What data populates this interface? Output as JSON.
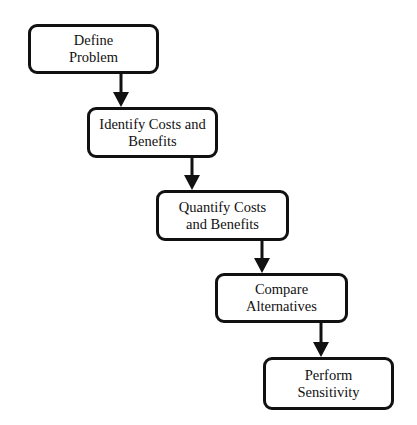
{
  "diagram": {
    "type": "flowchart",
    "direction": "top-left to bottom-right staircase",
    "colors": {
      "stroke": "#111111",
      "fill": "#ffffff",
      "text": "#111111"
    },
    "steps": [
      {
        "id": "step-1",
        "label": "Define\nProblem"
      },
      {
        "id": "step-2",
        "label": "Identify Costs and\nBenefits"
      },
      {
        "id": "step-3",
        "label": "Quantify Costs\nand Benefits"
      },
      {
        "id": "step-4",
        "label": "Compare\nAlternatives"
      },
      {
        "id": "step-5",
        "label": "Perform\nSensitivity"
      }
    ],
    "edges": [
      {
        "from": "step-1",
        "to": "step-2"
      },
      {
        "from": "step-2",
        "to": "step-3"
      },
      {
        "from": "step-3",
        "to": "step-4"
      },
      {
        "from": "step-4",
        "to": "step-5"
      }
    ]
  }
}
